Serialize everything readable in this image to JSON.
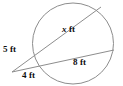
{
  "figure": {
    "kind": "geometry-diagram",
    "background_color": "#ffffff",
    "stroke_color": "#8d8d8d",
    "label_color": "#0d0d0d",
    "circle": {
      "center_x": 73,
      "center_y": 43.5,
      "radius": 41
    },
    "external_point": {
      "x": 12,
      "y": 72
    },
    "secants": [
      {
        "name": "upper-secant",
        "from_x": 12,
        "from_y": 72,
        "to_x": 101,
        "to_y": 7,
        "near_label": "5 ft",
        "far_label": "x ft"
      },
      {
        "name": "lower-secant",
        "from_x": 12,
        "from_y": 72,
        "to_x": 114,
        "to_y": 50,
        "near_label": "4 ft",
        "far_label": "8 ft"
      }
    ],
    "labels": {
      "upper_chord": {
        "value": "x",
        "unit": "ft",
        "text": "x ft"
      },
      "lower_chord": {
        "value": "8",
        "unit": "ft",
        "text": "8 ft"
      },
      "upper_external": {
        "value": "5",
        "unit": "ft",
        "text": "5 ft"
      },
      "lower_external": {
        "value": "4",
        "unit": "ft",
        "text": "4 ft"
      }
    }
  }
}
